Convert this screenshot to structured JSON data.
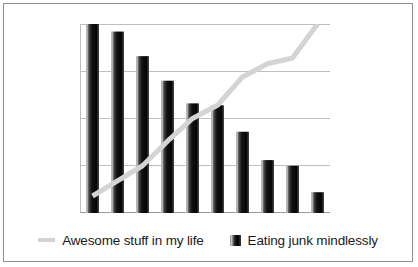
{
  "chart_data": {
    "type": "bar",
    "title": "",
    "subtitle": "",
    "xlabel": "",
    "ylabel": "",
    "categories": [
      "1",
      "2",
      "3",
      "4",
      "5",
      "6",
      "7",
      "8",
      "9",
      "10"
    ],
    "ylim": [
      0,
      100
    ],
    "yticks": [
      0,
      25,
      50,
      75,
      100
    ],
    "ytick_labels": [
      "",
      "",
      "",
      "",
      ""
    ],
    "xtick_labels": [
      "",
      "",
      "",
      "",
      "",
      "",
      "",
      "",
      "",
      ""
    ],
    "grid": true,
    "grid_axis": "y",
    "grid_color": "#bfbfbf",
    "legend_position": "bottom",
    "series": [
      {
        "name": "Eating junk mindlessly",
        "type": "bar",
        "color": "#1a1a1a",
        "values": [
          100,
          96,
          83,
          70,
          58,
          57,
          43,
          28,
          25,
          11
        ]
      },
      {
        "name": "Awesome stuff in my life",
        "type": "line",
        "color": "#d4d4d4",
        "values": [
          9,
          17,
          25,
          38,
          50,
          57,
          72,
          79,
          82,
          100
        ]
      }
    ]
  },
  "legend": {
    "entries": [
      {
        "label": "Awesome stuff in my life",
        "marker": "line-swatch",
        "color": "#d4d4d4"
      },
      {
        "label": "Eating junk mindlessly",
        "marker": "bar-swatch",
        "color": "#1a1a1a"
      }
    ]
  },
  "frame": {
    "border_color": "#8d8d8d",
    "background": "#ffffff"
  }
}
